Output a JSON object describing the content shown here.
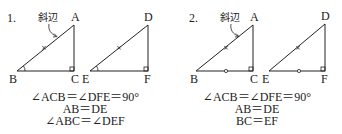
{
  "panels": [
    {
      "number": "1.",
      "hypotenuse_label": "斜辺",
      "triangle_left": {
        "vertices": [
          "A",
          "B",
          "C"
        ]
      },
      "triangle_right": {
        "vertices": [
          "D",
          "E",
          "F"
        ]
      },
      "marks": {
        "hypotenuse_tick": "×",
        "angle_at_base": "arc",
        "right_angle": "square"
      },
      "conditions": [
        "∠ACB＝∠DFE＝90°",
        "AB＝DE",
        "∠ABC＝∠DEF"
      ]
    },
    {
      "number": "2.",
      "hypotenuse_label": "斜辺",
      "triangle_left": {
        "vertices": [
          "A",
          "B",
          "C"
        ]
      },
      "triangle_right": {
        "vertices": [
          "D",
          "E",
          "F"
        ]
      },
      "marks": {
        "hypotenuse_tick": "×",
        "base_mark": "circle",
        "right_angle": "square"
      },
      "conditions": [
        "∠ACB＝∠DFE＝90°",
        "AB＝DE",
        "BC＝EF"
      ]
    }
  ],
  "colors": {
    "stroke": "#222222",
    "background": "#ffffff"
  }
}
